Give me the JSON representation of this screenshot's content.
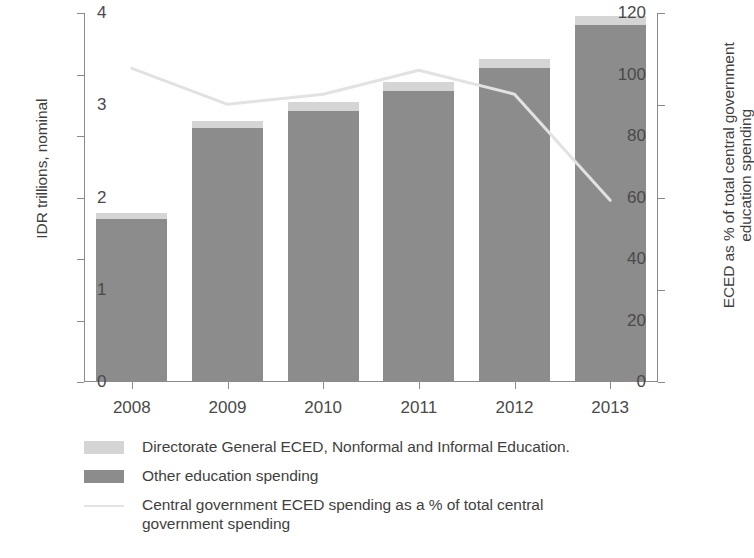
{
  "chart_data": {
    "type": "bar",
    "title": "",
    "subtitle": "",
    "categories": [
      "2008",
      "2009",
      "2010",
      "2011",
      "2012",
      "2013"
    ],
    "xlabel": "",
    "ylabel": "IDR trillions, nominal",
    "y2label_line1": "ECED as % of total central government",
    "y2label_line2": "education spending",
    "ylim": [
      0,
      120
    ],
    "y2lim": [
      0,
      4
    ],
    "yticks": [
      "0",
      "20",
      "40",
      "60",
      "80",
      "100",
      "120"
    ],
    "ytick_values": [
      0,
      20,
      40,
      60,
      80,
      100,
      120
    ],
    "y2ticks": [
      "0",
      "1",
      "2",
      "3",
      "4"
    ],
    "y2tick_values": [
      0,
      1,
      2,
      3,
      4
    ],
    "grid": false,
    "legend_position": "below-plot",
    "stacked": true,
    "series": [
      {
        "name": "Directorate General ECED, Nonformal and Informal Education.",
        "type": "bar",
        "axis": "left",
        "color": "#d5d5d5",
        "values": [
          2.0,
          2.5,
          3.0,
          3.0,
          3.0,
          3.0
        ]
      },
      {
        "name": "Other education spending",
        "type": "bar",
        "axis": "left",
        "color": "#8c8c8c",
        "values": [
          53.0,
          82.5,
          88.0,
          94.5,
          102.0,
          116.0
        ]
      },
      {
        "name": "Central government ECED spending as a % of total central government spending",
        "type": "line",
        "axis": "right",
        "color": "#e2e2e2",
        "values": [
          3.4,
          3.01,
          3.12,
          3.38,
          3.12,
          1.97
        ]
      }
    ],
    "bar_totals": [
      55.0,
      85.0,
      91.0,
      97.5,
      105.0,
      119.0
    ]
  },
  "legend": {
    "items": [
      {
        "label": "Directorate General ECED, Nonformal and Informal Education.",
        "swatch": "eced"
      },
      {
        "label": "Other education spending",
        "swatch": "other"
      },
      {
        "label": "Central government ECED spending as a % of total central\ngovernment spending",
        "swatch": "line"
      }
    ]
  }
}
